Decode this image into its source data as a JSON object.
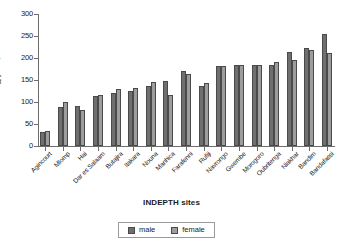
{
  "chart_data": {
    "type": "bar",
    "title": "",
    "xlabel": "INDEPTH sites",
    "ylabel": "5q0 per 1,000",
    "ylabel_parts": {
      "prefix": "5",
      "base": "q",
      "sub": "0",
      "suffix": " per 1,000"
    },
    "ylim": [
      0,
      300
    ],
    "yticks": [
      0,
      50,
      100,
      150,
      200,
      250,
      300
    ],
    "grid": false,
    "legend_position": "bottom-center",
    "categories": [
      "Agincourt",
      "Mlomp",
      "Hai",
      "Dar es Salaam",
      "Butajira",
      "Itakara",
      "Nouna",
      "Manhica",
      "Farafenni",
      "Rufiji",
      "Navrongo",
      "Gwembe",
      "Morogoro",
      "Oubritenga",
      "Niakhar",
      "Bandim",
      "Bandafassi"
    ],
    "series": [
      {
        "name": "male",
        "color": "#6f6f6f",
        "values": [
          32,
          89,
          92,
          114,
          120,
          126,
          137,
          148,
          171,
          136,
          181,
          183,
          183,
          185,
          213,
          223,
          255
        ]
      },
      {
        "name": "female",
        "color": "#9d9d9d",
        "values": [
          33,
          99,
          82,
          117,
          130,
          132,
          145,
          117,
          163,
          143,
          181,
          183,
          184,
          190,
          195,
          218,
          212
        ]
      }
    ]
  },
  "legend": {
    "items": [
      {
        "label": "male",
        "swatch": "male"
      },
      {
        "label": "female",
        "swatch": "female"
      }
    ]
  }
}
